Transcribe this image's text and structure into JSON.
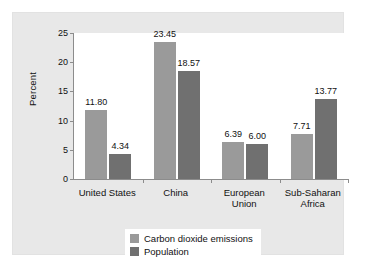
{
  "chart_data": {
    "type": "bar",
    "title": "",
    "xlabel": "",
    "ylabel": "Percent",
    "ylim": [
      0,
      25
    ],
    "yticks": [
      0,
      5,
      10,
      15,
      20,
      25
    ],
    "ytick_labels": [
      "0",
      "5",
      "10",
      "15",
      "20",
      "25"
    ],
    "grid": false,
    "legend_position": "bottom-right",
    "categories": [
      "United States",
      "China",
      "European Union",
      "Sub-Saharan Africa"
    ],
    "category_lines": [
      [
        "United States"
      ],
      [
        "China"
      ],
      [
        "European",
        "Union"
      ],
      [
        "Sub-Saharan",
        "Africa"
      ]
    ],
    "series": [
      {
        "name": "Carbon dioxide emissions",
        "color": "#9a9a9a",
        "values": [
          11.8,
          23.45,
          6.39,
          7.71
        ],
        "labels": [
          "11.80",
          "23.45",
          "6.39",
          "7.71"
        ]
      },
      {
        "name": "Population",
        "color": "#707070",
        "values": [
          4.34,
          18.57,
          6.0,
          13.77
        ],
        "labels": [
          "4.34",
          "18.57",
          "6.00",
          "13.77"
        ]
      }
    ]
  },
  "legend": {
    "items": [
      {
        "label": "Carbon dioxide emissions",
        "color": "#9a9a9a"
      },
      {
        "label": "Population",
        "color": "#707070"
      }
    ]
  },
  "colors": {
    "figure_background": "#ffffff",
    "panel_background": "#e8e8e8",
    "plot_background": "#ffffff",
    "axis": "#8c8c8c",
    "text": "#111111",
    "series_light": "#9a9a9a",
    "series_dark": "#707070"
  }
}
